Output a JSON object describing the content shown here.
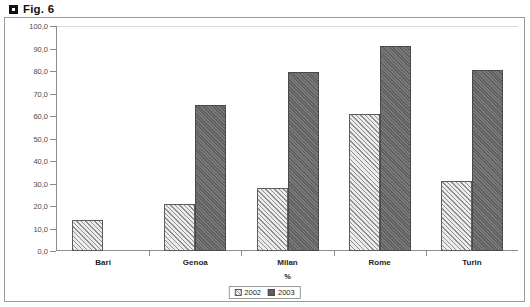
{
  "figure": {
    "title": "Fig. 6",
    "bullet_icon": "square-bullet-icon"
  },
  "chart_data": {
    "type": "bar",
    "title": "Fig. 6",
    "categories": [
      "Bari",
      "Genoa",
      "Milan",
      "Rome",
      "Turin"
    ],
    "series": [
      {
        "name": "2002",
        "values": [
          14.0,
          21.0,
          28.0,
          61.0,
          31.0
        ]
      },
      {
        "name": "2003",
        "values": [
          null,
          65.0,
          79.5,
          91.0,
          80.5
        ]
      }
    ],
    "xlabel": "%",
    "ylabel": "",
    "ylim": [
      0.0,
      100.0
    ],
    "ytick_step": 10.0,
    "ytick_labels": [
      "0,0",
      "10,0",
      "20,0",
      "30,0",
      "40,0",
      "50,0",
      "60,0",
      "70,0",
      "80,0",
      "90,0",
      "100,0"
    ],
    "grid": false,
    "legend_position": "bottom-center",
    "colors": {
      "series_2002": "#e9e9e9",
      "series_2003": "#6e6e6e",
      "axis": "#8d8d8d",
      "frame": "#9a9a9a"
    }
  },
  "legend": {
    "items": [
      {
        "label": "2002"
      },
      {
        "label": "2003"
      }
    ]
  }
}
